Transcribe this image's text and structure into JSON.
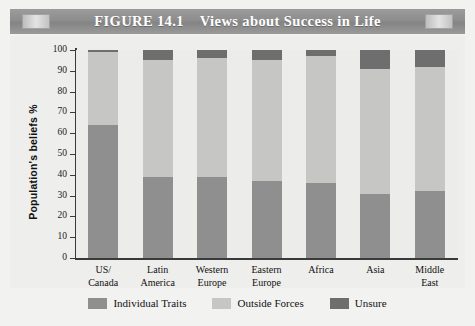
{
  "figure": {
    "label": "FIGURE 14.1",
    "title": "Views about Success in Life",
    "title_full": "FIGURE 14.1    Views about Success in Life"
  },
  "chart_data": {
    "type": "bar",
    "stacked": true,
    "title": "Views about Success in Life",
    "xlabel": "",
    "ylabel": "Population's beliefs %",
    "ylim": [
      0,
      100
    ],
    "ytick_step": 10,
    "yticks": [
      100,
      90,
      80,
      70,
      60,
      50,
      40,
      30,
      20,
      10,
      0
    ],
    "grid": true,
    "legend_position": "bottom",
    "categories": [
      "US/ Canada",
      "Latin America",
      "Western Europe",
      "Eastern Europe",
      "Africa",
      "Asia",
      "Middle East"
    ],
    "category_lines": [
      [
        "US/",
        "Canada"
      ],
      [
        "Latin",
        "America"
      ],
      [
        "Western",
        "Europe"
      ],
      [
        "Eastern",
        "Europe"
      ],
      [
        "Africa",
        ""
      ],
      [
        "Asia",
        ""
      ],
      [
        "Middle",
        "East"
      ]
    ],
    "series": [
      {
        "name": "Individual Traits",
        "color": "#8f8f8f",
        "values": [
          64,
          39,
          39,
          37,
          36,
          31,
          32
        ]
      },
      {
        "name": "Outside Forces",
        "color": "#c6c6c4",
        "values": [
          35,
          56,
          57,
          58,
          61,
          60,
          60
        ]
      },
      {
        "name": "Unsure",
        "color": "#6e6e6e",
        "values": [
          1,
          5,
          4,
          5,
          3,
          9,
          8
        ]
      }
    ]
  },
  "legend": {
    "items": [
      {
        "label": "Individual Traits",
        "color": "#8f8f8f"
      },
      {
        "label": "Outside Forces",
        "color": "#c6c6c4"
      },
      {
        "label": "Unsure",
        "color": "#6e6e6e"
      }
    ]
  },
  "colors": {
    "banner": "#8d8d8d",
    "panel": "#f2f2f1",
    "plot_background": "#ececeb",
    "axis": "#3a3a3a",
    "gridline": "#c9c9c7"
  }
}
